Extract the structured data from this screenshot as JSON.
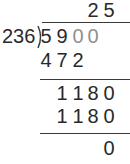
{
  "problem": {
    "divisor": "236",
    "dividend": [
      "5",
      "9",
      "0",
      "0"
    ],
    "quotient": [
      "2",
      "5"
    ],
    "step1_product": [
      "4",
      "7",
      "2"
    ],
    "step1_remainder": [
      "1",
      "1",
      "8",
      "0"
    ],
    "step2_product": [
      "1",
      "1",
      "8",
      "0"
    ],
    "final_remainder": [
      "0"
    ]
  },
  "colors": {
    "text": "#2a2a2a",
    "brought_down_digits": "#8f8f8f",
    "lines": "#3a3a3a"
  }
}
